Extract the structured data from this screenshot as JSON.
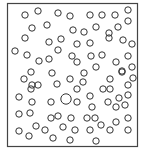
{
  "diagram": {
    "type": "particle-box",
    "colors": {
      "stroke": "#333333",
      "background": "#ffffff",
      "box": "#444444"
    },
    "box": {
      "x": 7.5,
      "y": 3.5,
      "width": 130,
      "height": 143,
      "stroke_width": 1.2
    },
    "particle_radius": 3.2,
    "large_particle_radius": 5.2,
    "particles": [
      [
        25,
        15
      ],
      [
        38,
        11
      ],
      [
        58,
        13
      ],
      [
        70,
        16
      ],
      [
        90,
        15
      ],
      [
        102,
        15
      ],
      [
        115,
        15
      ],
      [
        128,
        10
      ],
      [
        32,
        28
      ],
      [
        47,
        25
      ],
      [
        73,
        30
      ],
      [
        84,
        32
      ],
      [
        96,
        27
      ],
      [
        109,
        33
      ],
      [
        118,
        27
      ],
      [
        128,
        21
      ],
      [
        25,
        38
      ],
      [
        49,
        42
      ],
      [
        61,
        39
      ],
      [
        77,
        44
      ],
      [
        90,
        43
      ],
      [
        109,
        38
      ],
      [
        123,
        40
      ],
      [
        132,
        44
      ],
      [
        15,
        51
      ],
      [
        27,
        55
      ],
      [
        39,
        61
      ],
      [
        49,
        59
      ],
      [
        58,
        50
      ],
      [
        72,
        56
      ],
      [
        77,
        62
      ],
      [
        91,
        56
      ],
      [
        102,
        55
      ],
      [
        116,
        62
      ],
      [
        128,
        56
      ],
      [
        31,
        72
      ],
      [
        52,
        73
      ],
      [
        84,
        73
      ],
      [
        96,
        67
      ],
      [
        122,
        72
      ],
      [
        132,
        67
      ],
      [
        24,
        79
      ],
      [
        32,
        85
      ],
      [
        38,
        85
      ],
      [
        57,
        84
      ],
      [
        70,
        79
      ],
      [
        83,
        82
      ],
      [
        110,
        79
      ],
      [
        122,
        71
      ],
      [
        133,
        78
      ],
      [
        31,
        89
      ],
      [
        77,
        89
      ],
      [
        103,
        89
      ],
      [
        110,
        89
      ],
      [
        128,
        85
      ],
      [
        19,
        97
      ],
      [
        32,
        102
      ],
      [
        51,
        102
      ],
      [
        90,
        96
      ],
      [
        119,
        98
      ],
      [
        128,
        95
      ],
      [
        66,
        99
      ],
      [
        77,
        102
      ],
      [
        92,
        107
      ],
      [
        108,
        102
      ],
      [
        116,
        107
      ],
      [
        125,
        105
      ],
      [
        19,
        114
      ],
      [
        30,
        113
      ],
      [
        51,
        118
      ],
      [
        58,
        116
      ],
      [
        71,
        118
      ],
      [
        87,
        118
      ],
      [
        95,
        118
      ],
      [
        116,
        122
      ],
      [
        128,
        118
      ],
      [
        19,
        131
      ],
      [
        36,
        126
      ],
      [
        45,
        130
      ],
      [
        63,
        127
      ],
      [
        75,
        130
      ],
      [
        90,
        130
      ],
      [
        101,
        125
      ],
      [
        110,
        130
      ],
      [
        128,
        130
      ],
      [
        29,
        136
      ],
      [
        53,
        138
      ],
      [
        70,
        140
      ],
      [
        96,
        141
      ]
    ],
    "large_particles": [
      [
        66,
        99
      ]
    ]
  }
}
